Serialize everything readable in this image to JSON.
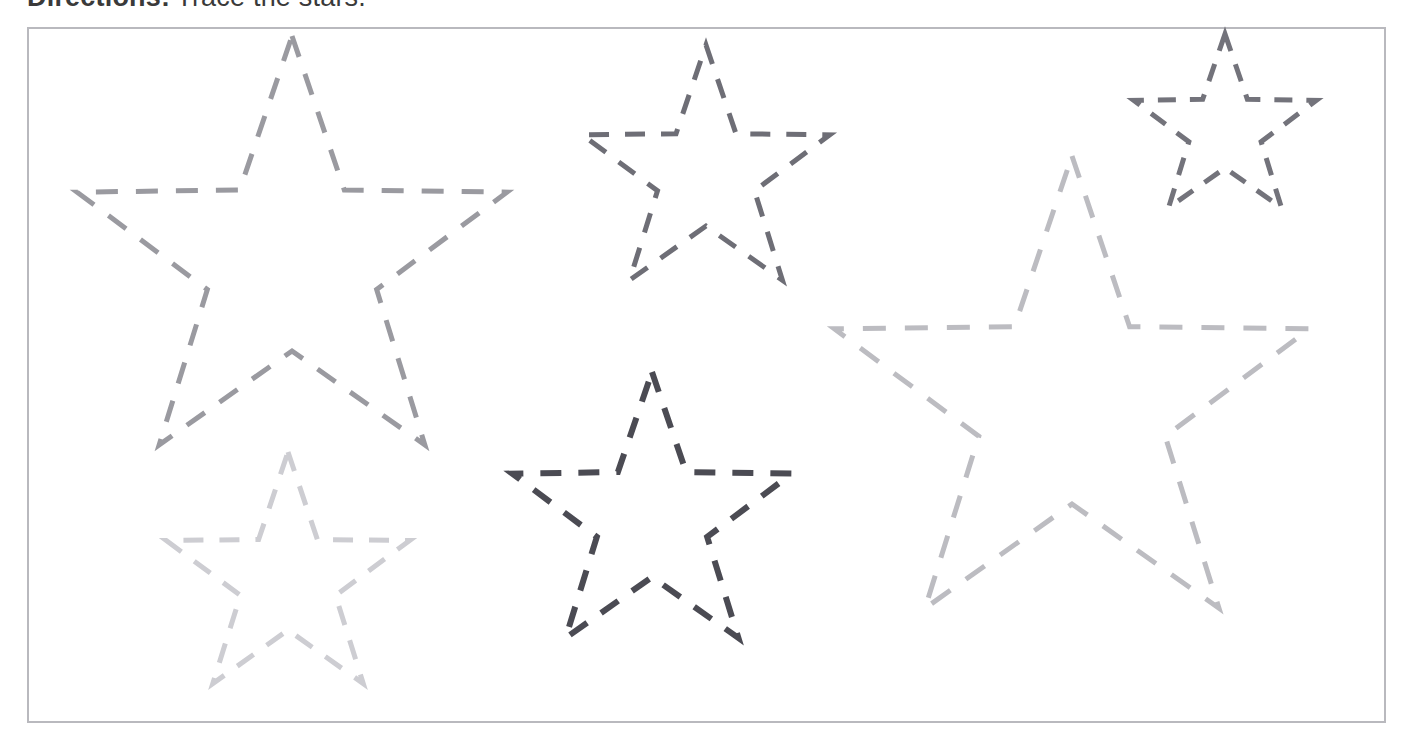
{
  "worksheet": {
    "directions_label": "Directions:",
    "directions_text": "Trace the stars.",
    "frame": {
      "x": 27,
      "y": 27,
      "width": 1359,
      "height": 696,
      "border_color": "#b9b9be",
      "background": "#ffffff"
    }
  },
  "chart_data": {
    "type": "scatter",
    "title": "Trace the stars.",
    "xlabel": "",
    "ylabel": "",
    "xlim": [
      27,
      1386
    ],
    "ylim": [
      27,
      723
    ],
    "grid": false,
    "legend": "none",
    "shape": "5-point-star",
    "stars": [
      {
        "name": "star-large-upper-left",
        "cx": 292,
        "cy": 262,
        "outer_radius": 226,
        "inner_radius": 89,
        "rotation_deg": 0,
        "stroke": "#9a9aa0",
        "stroke_width": 5,
        "dash": "22 18",
        "size_label": "large"
      },
      {
        "name": "star-medium-upper-center",
        "cx": 706,
        "cy": 175,
        "outer_radius": 130,
        "inner_radius": 51,
        "rotation_deg": 0,
        "stroke": "#6e6e76",
        "stroke_width": 5,
        "dash": "20 16",
        "size_label": "medium"
      },
      {
        "name": "star-small-upper-right",
        "cx": 1225,
        "cy": 130,
        "outer_radius": 96,
        "inner_radius": 38,
        "rotation_deg": 0,
        "stroke": "#73737b",
        "stroke_width": 5,
        "dash": "18 14",
        "size_label": "small"
      },
      {
        "name": "star-small-light-lower-left",
        "cx": 288,
        "cy": 580,
        "outer_radius": 128,
        "inner_radius": 50,
        "rotation_deg": 0,
        "stroke": "#cdcdd2",
        "stroke_width": 5,
        "dash": "20 16",
        "size_label": "small"
      },
      {
        "name": "star-medium-dark-lower-center",
        "cx": 652,
        "cy": 519,
        "outer_radius": 147,
        "inner_radius": 58,
        "rotation_deg": 0,
        "stroke": "#4b4b53",
        "stroke_width": 6,
        "dash": "21 17",
        "size_label": "medium"
      },
      {
        "name": "star-large-light-right",
        "cx": 1072,
        "cy": 406,
        "outer_radius": 250,
        "inner_radius": 98,
        "rotation_deg": 0,
        "stroke": "#bcbcc1",
        "stroke_width": 5,
        "dash": "23 19",
        "size_label": "large"
      }
    ]
  }
}
